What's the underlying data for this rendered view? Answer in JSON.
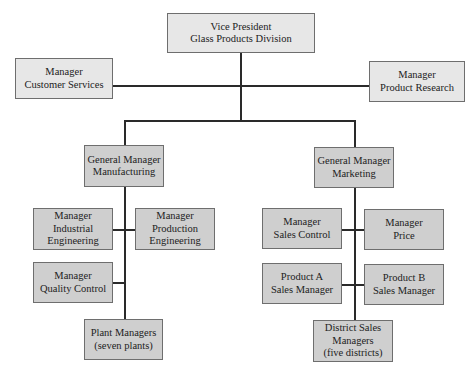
{
  "diagram": {
    "type": "organization-chart",
    "root": {
      "id": "vp",
      "lines": [
        "Vice President",
        "Glass Products Division"
      ],
      "staff": [
        {
          "id": "customer-services",
          "lines": [
            "Manager",
            "Customer Services"
          ]
        },
        {
          "id": "product-research",
          "lines": [
            "Manager",
            "Product Research"
          ]
        }
      ],
      "children": [
        {
          "id": "gm-manufacturing",
          "lines": [
            "General Manager",
            "Manufacturing"
          ],
          "children": [
            {
              "id": "industrial-engineering",
              "lines": [
                "Manager",
                "Industrial",
                "Engineering"
              ]
            },
            {
              "id": "production-engineering",
              "lines": [
                "Manager",
                "Production",
                "Engineering"
              ]
            },
            {
              "id": "quality-control",
              "lines": [
                "Manager",
                "Quality Control"
              ]
            },
            {
              "id": "plant-managers",
              "lines": [
                "Plant Managers",
                "(seven plants)"
              ]
            }
          ]
        },
        {
          "id": "gm-marketing",
          "lines": [
            "General Manager",
            "Marketing"
          ],
          "children": [
            {
              "id": "sales-control",
              "lines": [
                "Manager",
                "Sales Control"
              ]
            },
            {
              "id": "price",
              "lines": [
                "Manager",
                "Price"
              ]
            },
            {
              "id": "product-a",
              "lines": [
                "Product A",
                "Sales Manager"
              ]
            },
            {
              "id": "product-b",
              "lines": [
                "Product B",
                "Sales Manager"
              ]
            },
            {
              "id": "district-sales",
              "lines": [
                "District Sales",
                "Managers",
                "(five districts)"
              ]
            }
          ]
        }
      ]
    }
  },
  "boxes": {
    "vp": {
      "l1": "Vice President",
      "l2": "Glass Products Division"
    },
    "customer_services": {
      "l1": "Manager",
      "l2": "Customer Services"
    },
    "product_research": {
      "l1": "Manager",
      "l2": "Product Research"
    },
    "gm_manufacturing": {
      "l1": "General Manager",
      "l2": "Manufacturing"
    },
    "gm_marketing": {
      "l1": "General Manager",
      "l2": "Marketing"
    },
    "industrial_engineering": {
      "l1": "Manager",
      "l2": "Industrial",
      "l3": "Engineering"
    },
    "production_engineering": {
      "l1": "Manager",
      "l2": "Production",
      "l3": "Engineering"
    },
    "quality_control": {
      "l1": "Manager",
      "l2": "Quality Control"
    },
    "plant_managers": {
      "l1": "Plant Managers",
      "l2": "(seven plants)"
    },
    "sales_control": {
      "l1": "Manager",
      "l2": "Sales Control"
    },
    "price": {
      "l1": "Manager",
      "l2": "Price"
    },
    "product_a": {
      "l1": "Product A",
      "l2": "Sales Manager"
    },
    "product_b": {
      "l1": "Product B",
      "l2": "Sales Manager"
    },
    "district_sales": {
      "l1": "District Sales",
      "l2": "Managers",
      "l3": "(five districts)"
    }
  },
  "colors": {
    "top_level_fill": "#e7e7e7",
    "line_level_fill": "#cfcfcf",
    "border": "#6e6e6e",
    "connector": "#2a2a2a"
  }
}
